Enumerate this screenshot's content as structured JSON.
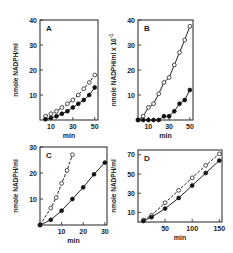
{
  "chart_data": [
    {
      "panel": "A",
      "type": "line",
      "title": "A",
      "xlabel": "min",
      "ylabel": "nmole NADPH/ml",
      "xticks": [
        10,
        30,
        50
      ],
      "yticks": [
        10,
        20,
        30,
        40
      ],
      "xlim": [
        0,
        53
      ],
      "ylim": [
        0,
        40
      ],
      "grid": false,
      "series": [
        {
          "name": "open circles",
          "marker": "open-circle",
          "line": "dashed",
          "x": [
            5,
            10,
            15,
            20,
            25,
            30,
            35,
            40,
            45,
            50
          ],
          "y": [
            1.5,
            2.5,
            3.5,
            5,
            6.5,
            8,
            10,
            12.5,
            15,
            18
          ]
        },
        {
          "name": "closed circles",
          "marker": "filled-circle",
          "line": "solid",
          "x": [
            5,
            10,
            15,
            20,
            25,
            30,
            35,
            40,
            45,
            50
          ],
          "y": [
            0.3,
            0.8,
            1.5,
            2.5,
            3.5,
            5,
            6.5,
            8,
            10,
            13
          ]
        }
      ]
    },
    {
      "panel": "B",
      "type": "line",
      "title": "B",
      "xlabel": "min",
      "ylabel": "nmole NADPH/ml x 10^-1",
      "ylabel_base": "nmole NADPH/ml x 10",
      "ylabel_exp": "-1",
      "xticks": [
        10,
        30,
        50
      ],
      "yticks": [
        10,
        20,
        30,
        40
      ],
      "xlim": [
        0,
        53
      ],
      "ylim": [
        0,
        40
      ],
      "grid": false,
      "series": [
        {
          "name": "open circles",
          "marker": "open-circle",
          "line": "solid",
          "x": [
            0,
            5,
            10,
            15,
            20,
            25,
            30,
            35,
            40,
            45,
            50
          ],
          "y": [
            0,
            1.5,
            5,
            6.5,
            10.5,
            15,
            17,
            22,
            27,
            32,
            37.5
          ]
        },
        {
          "name": "closed circles",
          "marker": "filled-circle",
          "line": "solid",
          "x": [
            0,
            5,
            10,
            15,
            20,
            25,
            30,
            35,
            40,
            45,
            50
          ],
          "y": [
            0,
            0,
            0,
            0,
            0,
            1.5,
            1.5,
            3.5,
            6.5,
            8,
            12
          ]
        }
      ]
    },
    {
      "panel": "C",
      "type": "line",
      "title": "C",
      "xlabel": "min",
      "ylabel": "nmole NADPH/ml",
      "xticks": [
        10,
        20,
        30
      ],
      "yticks": [
        10,
        20,
        30
      ],
      "xlim": [
        0,
        31
      ],
      "ylim": [
        0,
        30
      ],
      "grid": false,
      "series": [
        {
          "name": "open circles",
          "marker": "open-circle",
          "line": "dashed",
          "x": [
            0,
            5,
            7.5,
            10,
            12.5,
            15
          ],
          "y": [
            0,
            6.5,
            10.5,
            16,
            21,
            27
          ]
        },
        {
          "name": "closed circles",
          "marker": "filled-circle",
          "line": "solid",
          "x": [
            0,
            5,
            10,
            15,
            20,
            25,
            30
          ],
          "y": [
            0,
            2,
            5.5,
            10,
            14.5,
            19.5,
            24
          ]
        }
      ]
    },
    {
      "panel": "D",
      "type": "line",
      "title": "D",
      "xlabel": "min",
      "ylabel": "nmole NADPH/ml",
      "xticks": [
        50,
        100,
        150
      ],
      "yticks": [
        10,
        30,
        50,
        70
      ],
      "xlim": [
        0,
        155
      ],
      "ylim": [
        0,
        75
      ],
      "grid": false,
      "series": [
        {
          "name": "open circles",
          "marker": "open-circle",
          "line": "dashed",
          "x": [
            10,
            25,
            50,
            75,
            100,
            125,
            150
          ],
          "y": [
            2,
            7,
            20,
            33,
            46,
            59,
            71
          ]
        },
        {
          "name": "closed circles",
          "marker": "filled-circle",
          "line": "solid",
          "x": [
            10,
            25,
            50,
            75,
            100,
            125,
            150
          ],
          "y": [
            1,
            5,
            14,
            25,
            38,
            51,
            64
          ]
        }
      ]
    }
  ]
}
